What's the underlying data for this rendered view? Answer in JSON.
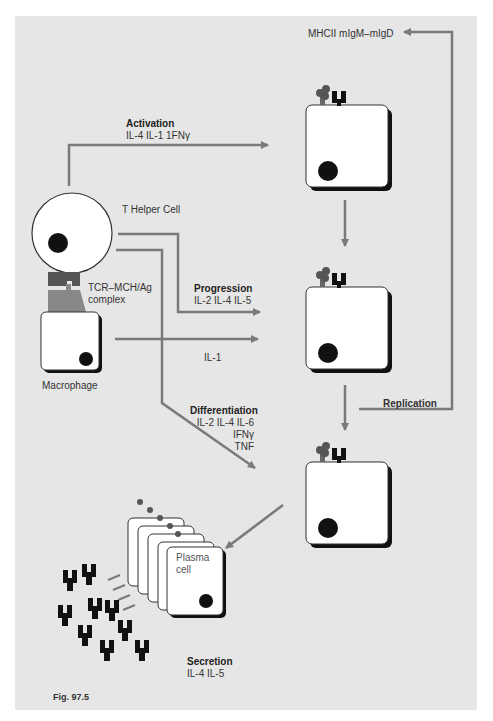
{
  "figure": {
    "caption": "Fig. 97.5",
    "colors": {
      "background": "#e6e6e6",
      "arrow": "#7a7a7a",
      "cell": "#ffffff",
      "nucleus": "#111111",
      "receptor": "#555555"
    }
  },
  "labels": {
    "mhc_top": "MHCII mIgM–mIgD",
    "activation_title": "Activation",
    "activation_cytokines": "IL-4 IL-1 1FNγ",
    "t_helper": "T Helper Cell",
    "tcr_complex_1": "TCR–MCH/Ag",
    "tcr_complex_2": "complex",
    "progression_title": "Progression",
    "progression_cytokines": "IL-2 IL-4 IL-5",
    "il1": "IL-1",
    "macrophage": "Macrophage",
    "differentiation_title": "Differentiation",
    "differentiation_line1": "IL-2 IL-4 IL-6",
    "differentiation_line2": "IFNγ",
    "differentiation_line3": "TNF",
    "replication": "Replication",
    "plasma_1": "Plasma",
    "plasma_2": "cell",
    "secretion_title": "Secretion",
    "secretion_cytokines": "IL-4 IL-5"
  }
}
